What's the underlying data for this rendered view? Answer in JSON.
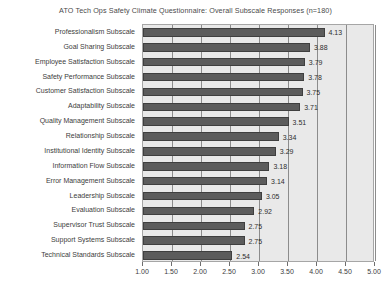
{
  "chart_data": {
    "type": "bar",
    "orientation": "horizontal",
    "title": "ATO Tech Ops Safety Climate Questionnaire: Overall Subscale Responses (n=180)",
    "xlabel": "",
    "ylabel": "",
    "xlim": [
      1.0,
      5.0
    ],
    "xticks": [
      "1.00",
      "1.50",
      "2.00",
      "2.50",
      "3.00",
      "3.50",
      "4.00",
      "4.50",
      "5.00"
    ],
    "xtick_values": [
      1.0,
      1.5,
      2.0,
      2.5,
      3.0,
      3.5,
      4.0,
      4.5,
      5.0
    ],
    "grid": true,
    "legend": false,
    "categories": [
      "Professionalism Subscale",
      "Goal Sharing Subscale",
      "Employee Satisfaction Subscale",
      "Safety Performance Subscale",
      "Customer Satisfaction Subscale",
      "Adaptability Subscale",
      "Quality Management Subscale",
      "Relationship Subscale",
      "Institutional Identity Subscale",
      "Information Flow Subscale",
      "Error Management Subscale",
      "Leadership Subscale",
      "Evaluation Subscale",
      "Supervisor Trust Subscale",
      "Support Systems Subscale",
      "Technical Standards Subscale"
    ],
    "values": [
      4.13,
      3.88,
      3.79,
      3.78,
      3.75,
      3.71,
      3.51,
      3.34,
      3.29,
      3.18,
      3.14,
      3.05,
      2.92,
      2.75,
      2.75,
      2.54
    ],
    "value_labels": [
      "4.13",
      "3.88",
      "3.79",
      "3.78",
      "3.75",
      "3.71",
      "3.51",
      "3.34",
      "3.29",
      "3.18",
      "3.14",
      "3.05",
      "2.92",
      "2.75",
      "2.75",
      "2.54"
    ],
    "colors": {
      "bar_fill": "#5c5c5c",
      "bar_edge": "#3f3f3f",
      "plot_background": "#e9e9e9",
      "gridline": "#8c8c8c",
      "frame": "#a6a6a6",
      "title_text": "#4a4a4a",
      "label_text": "#3d3d3d",
      "page_background": "#ffffff"
    }
  }
}
